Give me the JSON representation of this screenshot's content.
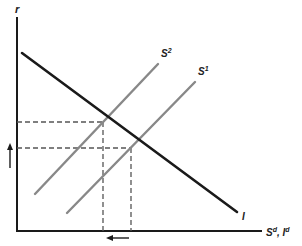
{
  "diagram": {
    "type": "saving-investment",
    "y_axis": {
      "label": "r"
    },
    "x_axis": {
      "label_main": "S",
      "label_main_sup": "d",
      "label_sep": ", ",
      "label_second": "I",
      "label_second_sup": "d"
    },
    "curves": [
      {
        "id": "investment",
        "label": "I",
        "sup": "",
        "color": "#1a1a1a",
        "from": [
          22,
          53
        ],
        "to": [
          237,
          212
        ]
      },
      {
        "id": "saving-2",
        "label": "S",
        "sup": "2",
        "color": "#888888",
        "from": [
          35,
          194
        ],
        "to": [
          158,
          64
        ]
      },
      {
        "id": "saving-1",
        "label": "S",
        "sup": "1",
        "color": "#888888",
        "from": [
          67,
          213
        ],
        "to": [
          195,
          82
        ]
      }
    ],
    "equilibria": [
      {
        "id": "new",
        "x": 103,
        "y": 122
      },
      {
        "id": "original",
        "x": 131,
        "y": 148
      }
    ],
    "arrows": [
      {
        "id": "interest-rate-rises",
        "direction": "up"
      },
      {
        "id": "quantity-falls",
        "direction": "left"
      }
    ],
    "colors": {
      "axis": "#1a1a1a",
      "dashed": "#555555",
      "supply": "#888888",
      "demand": "#1a1a1a"
    }
  }
}
